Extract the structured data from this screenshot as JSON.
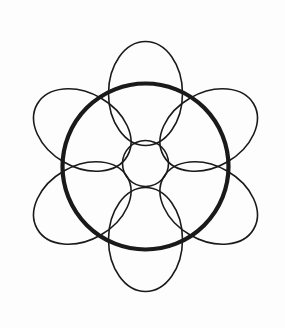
{
  "figure": {
    "background_color": "#fdfdfd",
    "canvas": {
      "width": 285,
      "height": 328
    },
    "stroke_color": "#1a1a1a",
    "thin_stroke_width": 1.6,
    "thick_stroke_width": 4.2,
    "center": {
      "x": 145.5,
      "y": 166
    },
    "hub_circle": {
      "name": "center-small-circle",
      "cx": 145.5,
      "cy": 163.5,
      "r": 23,
      "stroke_width": 1.6
    },
    "main_ring": {
      "name": "bold-outer-circle",
      "cx": 145.5,
      "cy": 166.5,
      "r": 83,
      "stroke_width": 4.2
    },
    "petal_geometry": {
      "count": 6,
      "rx": 37,
      "ry": 52,
      "orbit_radius": 73,
      "start_angle_deg": -90,
      "angle_step_deg": 60
    },
    "petals": [
      {
        "name": "petal-top",
        "angle_deg": -90,
        "cx": 145.5,
        "cy": 93.5,
        "rotation_deg": 0,
        "rx": 37,
        "ry": 52
      },
      {
        "name": "petal-upper-right",
        "angle_deg": -30,
        "cx": 208.7,
        "cy": 130.0,
        "rotation_deg": 60,
        "rx": 37,
        "ry": 52
      },
      {
        "name": "petal-lower-right",
        "angle_deg": 30,
        "cx": 208.7,
        "cy": 203.0,
        "rotation_deg": 120,
        "rx": 37,
        "ry": 52
      },
      {
        "name": "petal-bottom",
        "angle_deg": 90,
        "cx": 145.5,
        "cy": 239.5,
        "rotation_deg": 180,
        "rx": 37,
        "ry": 52
      },
      {
        "name": "petal-lower-left",
        "angle_deg": 150,
        "cx": 82.3,
        "cy": 203.0,
        "rotation_deg": 240,
        "rx": 37,
        "ry": 52
      },
      {
        "name": "petal-upper-left",
        "angle_deg": -150,
        "cx": 82.3,
        "cy": 130.0,
        "rotation_deg": 300,
        "rx": 37,
        "ry": 52
      }
    ]
  }
}
